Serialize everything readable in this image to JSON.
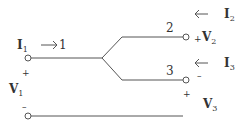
{
  "diagram": {
    "port1": {
      "current": "I",
      "current_sub": "1",
      "node": "1",
      "voltage": "V",
      "voltage_sub": "1",
      "plus": "+",
      "minus": "–"
    },
    "port2": {
      "current": "I",
      "current_sub": "2",
      "node": "2",
      "voltage": "V",
      "voltage_sub": "2",
      "plus": "+"
    },
    "port3": {
      "current": "I",
      "current_sub": "3",
      "node": "3",
      "voltage": "V",
      "voltage_sub": "3",
      "plus": "+",
      "minus": "–"
    },
    "line_color": "#555555"
  }
}
